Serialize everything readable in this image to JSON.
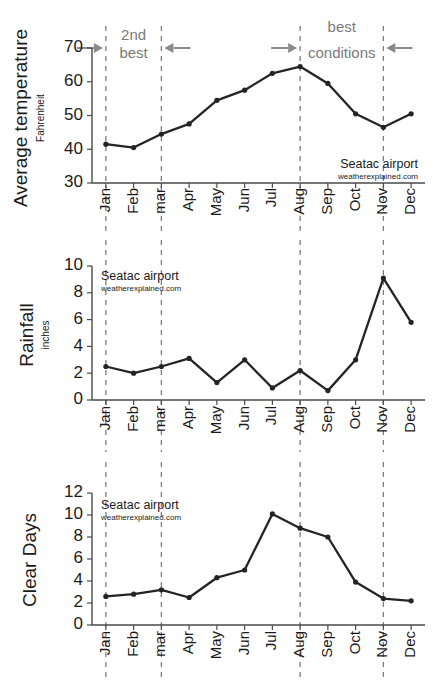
{
  "source": {
    "name": "Seatac airport",
    "url": "weatherexplained.com"
  },
  "annotations": {
    "second_best_line1": "2nd",
    "second_best_line2": "best",
    "best_line1": "best",
    "best_line2": "conditions"
  },
  "months": [
    "Jan",
    "Feb",
    "mar",
    "Apr",
    "May",
    "Jun",
    "Jul",
    "Aug",
    "Sep",
    "Oct",
    "Nov",
    "Dec"
  ],
  "colors": {
    "series": "#242424",
    "axis": "#4a4a4a",
    "guide": "#7d7d7d",
    "annotation": "#8a8a8a"
  },
  "chart_data": [
    {
      "type": "line",
      "id": "average-temperature",
      "title": "Average temperature",
      "subtitle": "Fahrenheit",
      "xlabel": "",
      "ylabel": "Average temperature",
      "yunit": "Fahrenheit",
      "categories": [
        "Jan",
        "Feb",
        "mar",
        "Apr",
        "May",
        "Jun",
        "Jul",
        "Aug",
        "Sep",
        "Oct",
        "Nov",
        "Dec"
      ],
      "values": [
        41.5,
        40.5,
        44.5,
        47.5,
        54.5,
        57.5,
        62.5,
        64.5,
        59.5,
        50.5,
        46.5,
        50.5
      ],
      "ylim": [
        30,
        70
      ],
      "yticks": [
        30,
        40,
        50,
        60,
        70
      ],
      "grid": false,
      "legend": "none",
      "guide_months": [
        "Jan",
        "mar",
        "Aug",
        "Nov"
      ],
      "source_name": "Seatac airport",
      "source_url": "weatherexplained.com"
    },
    {
      "type": "line",
      "id": "rainfall",
      "title": "Rainfall",
      "subtitle": "inches",
      "xlabel": "",
      "ylabel": "Rainfall",
      "yunit": "inches",
      "categories": [
        "Jan",
        "Feb",
        "mar",
        "Apr",
        "May",
        "Jun",
        "Jul",
        "Aug",
        "Sep",
        "Oct",
        "Nov",
        "Dec"
      ],
      "values": [
        2.5,
        2.0,
        2.5,
        3.1,
        1.3,
        3.0,
        0.9,
        2.2,
        0.7,
        3.0,
        9.1,
        5.8
      ],
      "ylim": [
        0,
        10
      ],
      "yticks": [
        0,
        2,
        4,
        6,
        8,
        10
      ],
      "grid": false,
      "legend": "none",
      "guide_months": [
        "Jan",
        "mar",
        "Aug",
        "Nov"
      ],
      "source_name": "Seatac airport",
      "source_url": "weatherexplained.com"
    },
    {
      "type": "line",
      "id": "clear-days",
      "title": "Clear Days",
      "subtitle": "",
      "xlabel": "",
      "ylabel": "Clear Days",
      "yunit": "",
      "categories": [
        "Jan",
        "Feb",
        "mar",
        "Apr",
        "May",
        "Jun",
        "Jul",
        "Aug",
        "Sep",
        "Oct",
        "Nov",
        "Dec"
      ],
      "values": [
        2.6,
        2.8,
        3.2,
        2.5,
        4.3,
        5.0,
        10.1,
        8.8,
        8.0,
        3.9,
        2.4,
        2.2
      ],
      "ylim": [
        0,
        12
      ],
      "yticks": [
        0,
        2,
        4,
        6,
        8,
        10,
        12
      ],
      "grid": false,
      "legend": "none",
      "guide_months": [
        "Jan",
        "mar",
        "Aug",
        "Nov"
      ],
      "source_name": "Seatac airport",
      "source_url": "weatherexplained.com"
    }
  ]
}
